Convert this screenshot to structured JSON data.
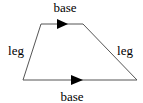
{
  "diagram": {
    "shape": "trapezoid",
    "labels": {
      "top_base": "base",
      "bottom_base": "base",
      "left_leg": "leg",
      "right_leg": "leg"
    },
    "vertices": {
      "top_left": [
        41,
        24
      ],
      "top_right": [
        83,
        24
      ],
      "bottom_right": [
        137,
        80
      ],
      "bottom_left": [
        23,
        80
      ]
    },
    "parallel_markers": [
      "top_base",
      "bottom_base"
    ],
    "stroke_color": "#555555",
    "marker_color": "#000000"
  }
}
